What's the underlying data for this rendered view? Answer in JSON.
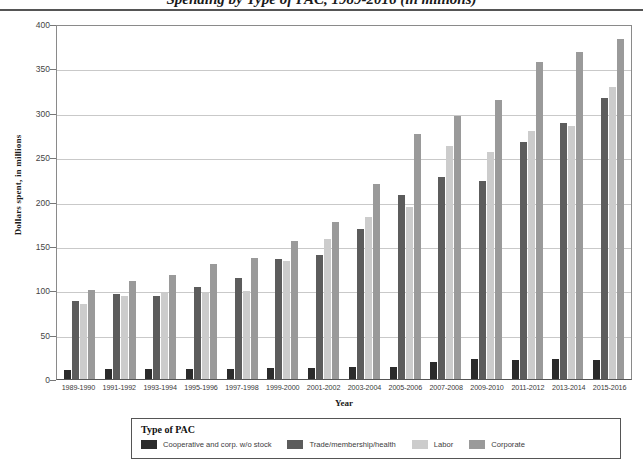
{
  "title": "Spending by Type of PAC, 1989-2016 (in millions)",
  "axis": {
    "ylabel": "Dollars spent, in millions",
    "xlabel": "Year",
    "yticks": [
      "400",
      "350",
      "300",
      "250",
      "200",
      "150",
      "100",
      "50",
      "0"
    ]
  },
  "legend": {
    "title": "Type of PAC",
    "items": [
      {
        "label": "Cooperative and corp. w/o stock",
        "color": "#2b2b2b"
      },
      {
        "label": "Trade/membership/health",
        "color": "#5c5c5c"
      },
      {
        "label": "Labor",
        "color": "#cccccc"
      },
      {
        "label": "Corporate",
        "color": "#9a9a9a"
      }
    ]
  },
  "chart_data": {
    "type": "bar",
    "title": "Spending by Type of PAC, 1989-2016 (in millions)",
    "xlabel": "Year",
    "ylabel": "Dollars spent, in millions",
    "ylim": [
      0,
      400
    ],
    "ytick_step": 50,
    "grid": true,
    "legend_position": "bottom",
    "categories": [
      "1989-1990",
      "1991-1992",
      "1993-1994",
      "1995-1996",
      "1997-1998",
      "1999-2000",
      "2001-2002",
      "2003-2004",
      "2005-2006",
      "2007-2008",
      "2009-2010",
      "2011-2012",
      "2013-2014",
      "2015-2016"
    ],
    "series": [
      {
        "name": "Cooperative and corp. w/o stock",
        "color": "#2b2b2b",
        "values": [
          10,
          11,
          11,
          11,
          11,
          12,
          12,
          13,
          14,
          19,
          23,
          21,
          23,
          21
        ]
      },
      {
        "name": "Trade/membership/health",
        "color": "#5c5c5c",
        "values": [
          88,
          96,
          93,
          104,
          114,
          135,
          140,
          169,
          207,
          228,
          223,
          267,
          288,
          317
        ]
      },
      {
        "name": "Labor",
        "color": "#cccccc",
        "values": [
          84,
          94,
          97,
          97,
          99,
          133,
          158,
          183,
          194,
          263,
          256,
          279,
          285,
          329
        ]
      },
      {
        "name": "Corporate",
        "color": "#9a9a9a",
        "values": [
          100,
          111,
          117,
          130,
          136,
          156,
          177,
          220,
          276,
          296,
          314,
          357,
          368,
          383
        ]
      }
    ]
  }
}
